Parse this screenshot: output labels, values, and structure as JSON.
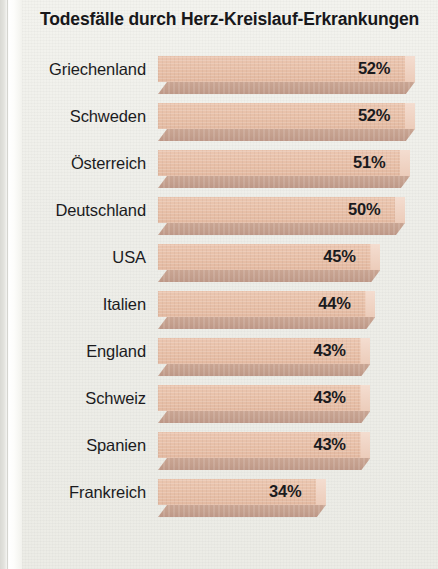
{
  "chart_data": {
    "type": "bar",
    "title": "Todesfälle durch Herz-Kreislauf-Erkrankungen",
    "xlabel": "",
    "ylabel": "",
    "orientation": "horizontal",
    "grid": false,
    "legend": null,
    "value_suffix": "%",
    "categories": [
      "Griechenland",
      "Schweden",
      "Österreich",
      "Deutschland",
      "USA",
      "Italien",
      "England",
      "Schweiz",
      "Spanien",
      "Frankreich"
    ],
    "values": [
      52,
      52,
      51,
      50,
      45,
      44,
      43,
      43,
      43,
      34
    ],
    "value_labels": [
      "52%",
      "52%",
      "51%",
      "50%",
      "45%",
      "44%",
      "43%",
      "43%",
      "43%",
      "34%"
    ],
    "xlim": [
      0,
      54
    ],
    "bars": [
      {
        "label": "Griechenland",
        "value": 52,
        "value_label": "52%"
      },
      {
        "label": "Schweden",
        "value": 52,
        "value_label": "52%"
      },
      {
        "label": "Österreich",
        "value": 51,
        "value_label": "51%"
      },
      {
        "label": "Deutschland",
        "value": 50,
        "value_label": "50%"
      },
      {
        "label": "USA",
        "value": 45,
        "value_label": "45%"
      },
      {
        "label": "Italien",
        "value": 44,
        "value_label": "44%"
      },
      {
        "label": "England",
        "value": 43,
        "value_label": "43%"
      },
      {
        "label": "Schweiz",
        "value": 43,
        "value_label": "43%"
      },
      {
        "label": "Spanien",
        "value": 43,
        "value_label": "43%"
      },
      {
        "label": "Frankreich",
        "value": 34,
        "value_label": "34%"
      }
    ],
    "colors": {
      "bar_fill": "#e7bfa7",
      "bar_shadow": "#c39e8c",
      "bar_cap": "#f1d6c6",
      "background": "#efefea",
      "text": "#1b1b1e"
    }
  }
}
